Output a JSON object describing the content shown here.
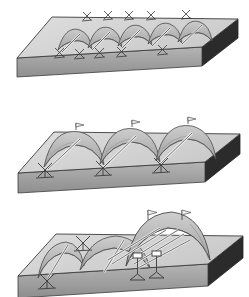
{
  "figure": {
    "panel_count": 3
  },
  "colors": {
    "slab_top": "#d0d0d0",
    "slab_top_light": "#dcdcdc",
    "slab_front_edge": "#9a9a9a",
    "slab_right_edge": "#2e2e2e",
    "slab_outline": "#3c3c3c",
    "vault_shell": "#b3b3b3",
    "vault_shell_light": "#c8c8c8",
    "vault_shell_dark": "#9d9d9d",
    "vault_outline": "#4a4a4a",
    "prop_rod": "#f0f0f0",
    "prop_outline": "#3f3f3f",
    "trestle": "#ffffff",
    "trestle_outline": "#3a3a3a",
    "flag": "#e8e8e8",
    "background": "#ffffff"
  },
  "panels": [
    {
      "id": "panel-1",
      "name": "small-vaults-panel",
      "caption": "",
      "vault_count": 5,
      "vault_span": 30,
      "vault_rise": 17,
      "trestle_rows": 2,
      "trestles_front": 5,
      "trestles_back": 5,
      "prop_count": 5,
      "flag_count": 0,
      "scale_label": "small"
    },
    {
      "id": "panel-2",
      "name": "medium-vaults-panel",
      "caption": "",
      "vault_count": 3,
      "vault_span": 54,
      "vault_rise": 26,
      "trestle_rows": 1,
      "trestles_front": 3,
      "trestles_back": 0,
      "prop_count": 3,
      "flag_count": 3,
      "scale_label": "medium"
    },
    {
      "id": "panel-3",
      "name": "large-vault-panel",
      "caption": "",
      "vault_count": 3,
      "vault_span": 78,
      "vault_rise": 40,
      "trestle_rows": 1,
      "trestles_front": 3,
      "trestles_back": 0,
      "prop_count": 7,
      "flag_count": 2,
      "scale_label": "large"
    }
  ],
  "legend": {
    "slab": "slab",
    "vault": "vault shell",
    "trestle": "trestle support",
    "prop": "diagonal prop",
    "flag": "ridge marker"
  }
}
